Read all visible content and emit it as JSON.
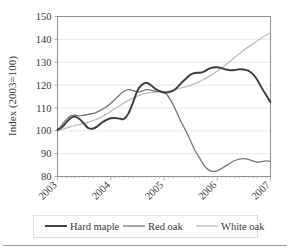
{
  "chart_data": {
    "type": "line",
    "title": "",
    "xlabel": "",
    "ylabel": "Index (2003=100)",
    "ylim": [
      80,
      150
    ],
    "yticks": [
      80,
      90,
      100,
      110,
      120,
      130,
      140,
      150
    ],
    "xtick_labels": [
      "2003",
      "2004",
      "2005",
      "2006",
      "2007"
    ],
    "xlim": [
      2003.0,
      2007.0
    ],
    "grid": true,
    "legend_position": "bottom",
    "series": [
      {
        "name": "Hard maple",
        "color": "#3c3c3c",
        "width": 1.9,
        "x": [
          2003.0,
          2003.08,
          2003.17,
          2003.25,
          2003.33,
          2003.42,
          2003.5,
          2003.58,
          2003.67,
          2003.75,
          2003.83,
          2003.92,
          2004.0,
          2004.08,
          2004.17,
          2004.25,
          2004.33,
          2004.42,
          2004.5,
          2004.58,
          2004.67,
          2004.75,
          2004.83,
          2004.92,
          2005.0,
          2005.08,
          2005.17,
          2005.25,
          2005.33,
          2005.42,
          2005.5,
          2005.58,
          2005.67,
          2005.75,
          2005.83,
          2005.92,
          2006.0,
          2006.08,
          2006.17,
          2006.25,
          2006.33,
          2006.42,
          2006.5,
          2006.58,
          2006.67,
          2006.75,
          2006.83,
          2006.92,
          2007.0
        ],
        "values": [
          100.3,
          101.5,
          103.8,
          105.6,
          106.2,
          105.0,
          103.0,
          101.2,
          101.0,
          102.0,
          103.5,
          104.8,
          105.5,
          105.6,
          105.3,
          105.2,
          107.5,
          112.5,
          117.5,
          120.0,
          121.0,
          120.0,
          118.5,
          117.3,
          116.7,
          116.8,
          117.5,
          119.0,
          121.0,
          123.0,
          124.6,
          125.3,
          125.4,
          125.9,
          127.0,
          127.7,
          127.8,
          127.4,
          126.8,
          126.5,
          126.6,
          126.9,
          126.8,
          126.3,
          124.8,
          122.3,
          119.0,
          115.5,
          112.5
        ]
      },
      {
        "name": "Red oak",
        "color": "#777777",
        "width": 1.3,
        "x": [
          2003.0,
          2003.08,
          2003.17,
          2003.25,
          2003.33,
          2003.42,
          2003.5,
          2003.58,
          2003.67,
          2003.75,
          2003.83,
          2003.92,
          2004.0,
          2004.08,
          2004.17,
          2004.25,
          2004.33,
          2004.42,
          2004.5,
          2004.58,
          2004.67,
          2004.75,
          2004.83,
          2004.92,
          2005.0,
          2005.08,
          2005.17,
          2005.25,
          2005.33,
          2005.42,
          2005.5,
          2005.58,
          2005.67,
          2005.75,
          2005.83,
          2005.92,
          2006.0,
          2006.08,
          2006.17,
          2006.25,
          2006.33,
          2006.42,
          2006.5,
          2006.58,
          2006.67,
          2006.75,
          2006.83,
          2006.92,
          2007.0
        ],
        "values": [
          100.5,
          102.5,
          105.0,
          106.5,
          106.8,
          106.5,
          106.8,
          107.2,
          107.6,
          108.3,
          109.3,
          110.5,
          112.0,
          113.8,
          115.8,
          117.3,
          118.0,
          117.6,
          117.0,
          117.3,
          118.0,
          117.8,
          117.4,
          117.2,
          117.0,
          115.0,
          111.5,
          107.5,
          103.5,
          99.5,
          95.5,
          91.5,
          88.0,
          85.0,
          83.0,
          82.2,
          82.5,
          83.5,
          84.8,
          86.0,
          87.0,
          87.6,
          87.8,
          87.5,
          86.8,
          86.3,
          86.5,
          86.8,
          86.5
        ]
      },
      {
        "name": "White oak",
        "color": "#bdbdbd",
        "width": 1.3,
        "x": [
          2003.0,
          2003.08,
          2003.17,
          2003.25,
          2003.33,
          2003.42,
          2003.5,
          2003.58,
          2003.67,
          2003.75,
          2003.83,
          2003.92,
          2004.0,
          2004.08,
          2004.17,
          2004.25,
          2004.33,
          2004.42,
          2004.5,
          2004.58,
          2004.67,
          2004.75,
          2004.83,
          2004.92,
          2005.0,
          2005.08,
          2005.17,
          2005.25,
          2005.33,
          2005.42,
          2005.5,
          2005.58,
          2005.67,
          2005.75,
          2005.83,
          2005.92,
          2006.0,
          2006.08,
          2006.17,
          2006.25,
          2006.33,
          2006.42,
          2006.5,
          2006.58,
          2006.67,
          2006.75,
          2006.83,
          2006.92,
          2007.0
        ],
        "values": [
          100.2,
          100.6,
          101.2,
          101.8,
          102.3,
          102.8,
          103.3,
          103.8,
          104.4,
          105.2,
          106.2,
          107.3,
          108.5,
          109.8,
          111.0,
          112.2,
          113.3,
          114.3,
          115.2,
          115.9,
          116.4,
          116.7,
          116.9,
          117.0,
          117.1,
          117.4,
          117.8,
          118.3,
          118.8,
          119.3,
          119.9,
          120.6,
          121.5,
          122.5,
          123.6,
          124.8,
          126.1,
          127.5,
          129.0,
          130.6,
          132.2,
          133.8,
          135.3,
          136.7,
          138.0,
          139.3,
          140.6,
          141.9,
          143.0
        ]
      }
    ]
  },
  "legend": {
    "items": [
      {
        "label": "Hard maple"
      },
      {
        "label": "Red oak"
      },
      {
        "label": "White oak"
      }
    ]
  }
}
